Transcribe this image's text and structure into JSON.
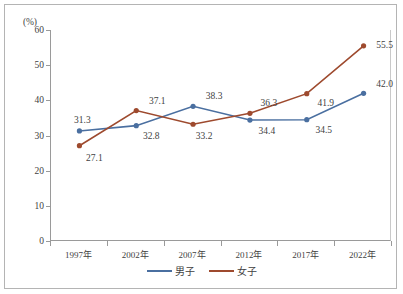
{
  "chart_data": {
    "type": "line",
    "title": "",
    "xlabel": "",
    "ylabel": "(%)",
    "unit_label": "(%)",
    "ylim": [
      0,
      60
    ],
    "ytick_step": 10,
    "grid": false,
    "legend_position": "bottom-center",
    "categories": [
      "1997年",
      "2002年",
      "2007年",
      "2012年",
      "2017年",
      "2022年"
    ],
    "ytick_labels": [
      "60",
      "50",
      "40",
      "30",
      "20",
      "10",
      "0"
    ],
    "series": [
      {
        "name": "男子",
        "color": "#4a6fa0",
        "values": [
          31.3,
          32.8,
          38.3,
          34.4,
          34.5,
          42.0
        ],
        "labels": [
          "31.3",
          "32.8",
          "38.3",
          "34.4",
          "34.5",
          "42.0"
        ]
      },
      {
        "name": "女子",
        "color": "#9e4a2e",
        "values": [
          27.1,
          37.1,
          33.2,
          36.3,
          41.9,
          55.5
        ],
        "labels": [
          "27.1",
          "37.1",
          "33.2",
          "36.3",
          "41.9",
          "55.5"
        ]
      }
    ]
  },
  "legend": {
    "entries": [
      {
        "label": "男子",
        "color": "#4a6fa0"
      },
      {
        "label": "女子",
        "color": "#9e4a2e"
      }
    ]
  },
  "colors": {
    "series_male": "#4a6fa0",
    "series_female": "#9e4a2e",
    "axis": "#9a9a9a",
    "text": "#3f3f3f",
    "frame": "#b4b4b4"
  }
}
